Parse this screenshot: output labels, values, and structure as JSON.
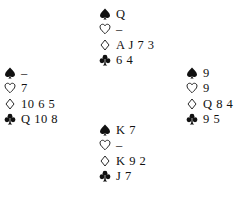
{
  "hands": {
    "north": {
      "spades": "Q",
      "hearts": "–",
      "diamonds": "A J 7 3",
      "clubs": "6 4"
    },
    "west": {
      "spades": "–",
      "hearts": "7",
      "diamonds": "10 6 5",
      "clubs": "Q 10 8"
    },
    "east": {
      "spades": "9",
      "hearts": "9",
      "diamonds": "Q 8 4",
      "clubs": "9 5"
    },
    "south": {
      "spades": "K 7",
      "hearts": "–",
      "diamonds": "K 9 2",
      "clubs": "J 7"
    }
  },
  "suit_icons": {
    "spades": "spade-icon",
    "hearts": "heart-icon",
    "diamonds": "diamond-icon",
    "clubs": "club-icon"
  },
  "colors": {
    "ink": "#111111",
    "background": "#ffffff"
  }
}
